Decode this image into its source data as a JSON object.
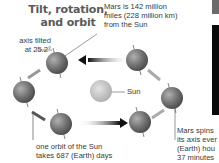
{
  "title": {
    "line1": "Tilt, rotation,",
    "line2": "and orbit"
  },
  "labels": {
    "axis_tilt": {
      "line1": "axis tilted",
      "line2": "at 25.2°"
    },
    "distance": {
      "line1": "Mars is 142 million",
      "line2": "miles (228 million km)",
      "line3": "from the Sun"
    },
    "sun": "Sun",
    "orbit": {
      "line1": "one orbit of the Sun",
      "line2": "takes 687 (Earth) days"
    },
    "spin": {
      "line1": "Mars spins",
      "line2": "its axis ever",
      "line3": "(Earth) hou",
      "line4": "37 minutes"
    }
  },
  "colors": {
    "planet": "#7a7a7a",
    "sun": "#c8c8c8",
    "text": "#3a3a3a",
    "arrow": "#111111"
  }
}
